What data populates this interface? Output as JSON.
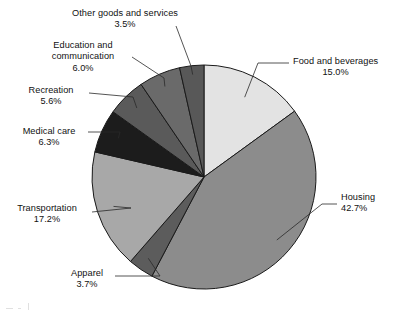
{
  "figure": {
    "background_color": "#ffffff",
    "outline_color": "#1a1a1a",
    "artifact_note": ""
  },
  "chart_data": {
    "type": "pie",
    "title": "",
    "subtitle": "",
    "xlabel": "",
    "ylabel": "",
    "legend_position": "none",
    "grid": false,
    "units": "percent",
    "total": 100.0,
    "start_angle_deg": 0,
    "direction": "clockwise",
    "center": {
      "x": 204,
      "y": 177,
      "radius": 112
    },
    "categories": [
      "Food and beverages",
      "Housing",
      "Apparel",
      "Transportation",
      "Medical care",
      "Recreation",
      "Education and communication",
      "Other goods and services"
    ],
    "values": [
      15.0,
      42.7,
      3.7,
      17.2,
      6.3,
      5.6,
      6.0,
      3.5
    ],
    "slices": [
      {
        "label": "Food and beverages",
        "value": 15.0,
        "value_text": "15.0%",
        "color": "#e3e3e3",
        "label_align": "left",
        "label_left": 293,
        "label_top": 56
      },
      {
        "label": "Housing",
        "value": 42.7,
        "value_text": "42.7%",
        "color": "#8c8c8c",
        "label_align": "left",
        "label_left": 341,
        "label_top": 192
      },
      {
        "label": "Apparel",
        "value": 3.7,
        "value_text": "3.7%",
        "color": "#5c5c5c",
        "label_align": "center",
        "label_left": 57,
        "label_top": 268
      },
      {
        "label": "Transportation",
        "value": 17.2,
        "value_text": "17.2%",
        "color": "#a8a8a8",
        "label_align": "center",
        "label_left": 8,
        "label_top": 203
      },
      {
        "label": "Medical care",
        "value": 6.3,
        "value_text": "6.3%",
        "color": "#1c1c1c",
        "label_align": "center",
        "label_left": 13,
        "label_top": 126
      },
      {
        "label": "Recreation",
        "value": 5.6,
        "value_text": "5.6%",
        "color": "#5a5a5a",
        "label_align": "center",
        "label_left": 17,
        "label_top": 85
      },
      {
        "label": "Education and communication",
        "value": 6.0,
        "value_text": "6.0%",
        "color": "#6a6a6a",
        "label_align": "center",
        "label_left": 34,
        "label_top": 40
      },
      {
        "label": "Other goods and services",
        "value": 3.5,
        "value_text": "3.5%",
        "color": "#585858",
        "label_align": "center",
        "label_left": 55,
        "label_top": 8
      }
    ]
  }
}
